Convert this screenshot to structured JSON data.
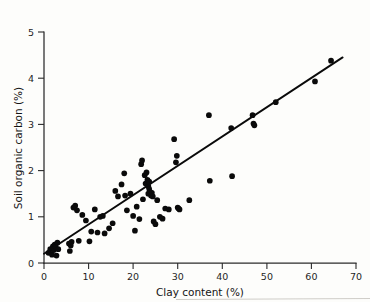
{
  "figure": {
    "background_color": "#fdfdfb",
    "ink_color": "#0a0a0a",
    "artifact_color": "#c9c7c2"
  },
  "chart_data": {
    "type": "scatter",
    "title": "",
    "subtitle": "",
    "xlabel": "Clay content (%)",
    "ylabel": "Soil organic carbon (%)",
    "xlim": [
      0,
      70
    ],
    "ylim": [
      0,
      5
    ],
    "xticks": [
      0,
      10,
      20,
      30,
      40,
      50,
      60,
      70
    ],
    "xticklabels": [
      "0",
      "10",
      "20",
      "30",
      "40",
      "50",
      "60",
      "70"
    ],
    "yticks": [
      0,
      1,
      2,
      3,
      4,
      5
    ],
    "yticklabels": [
      "0",
      "1",
      "2",
      "3",
      "4",
      "5"
    ],
    "grid": false,
    "legend": null,
    "marker": "filled-circle",
    "marker_size_px": 4.6,
    "series": [
      {
        "name": "Soil samples",
        "x": [
          1.0,
          1.4,
          1.8,
          2.0,
          2.2,
          2.4,
          2.6,
          2.8,
          3.0,
          3.2,
          5.6,
          5.8,
          6.0,
          6.2,
          6.6,
          7.0,
          7.4,
          7.8,
          8.6,
          9.4,
          10.2,
          10.6,
          11.4,
          12.0,
          12.6,
          13.2,
          13.6,
          14.6,
          15.4,
          16.0,
          16.6,
          17.4,
          18.0,
          18.2,
          18.6,
          19.4,
          20.0,
          20.4,
          20.8,
          21.4,
          21.8,
          22.0,
          22.2,
          22.6,
          22.8,
          23.0,
          23.2,
          23.4,
          23.4,
          23.6,
          23.6,
          23.8,
          24.0,
          24.2,
          24.4,
          24.6,
          25.0,
          25.4,
          26.0,
          26.6,
          27.2,
          28.0,
          29.2,
          29.6,
          29.8,
          30.0,
          30.2,
          30.4,
          32.6,
          37.0,
          37.2,
          42.0,
          42.2,
          46.8,
          47.0,
          47.2,
          52.0,
          60.8,
          64.4
        ],
        "y": [
          0.22,
          0.3,
          0.18,
          0.36,
          0.28,
          0.4,
          0.34,
          0.16,
          0.44,
          0.3,
          0.42,
          0.26,
          0.38,
          0.46,
          1.2,
          1.24,
          1.14,
          0.48,
          1.04,
          0.92,
          0.47,
          0.68,
          1.16,
          0.66,
          1.0,
          1.02,
          0.64,
          0.75,
          0.86,
          1.56,
          1.44,
          1.7,
          1.94,
          1.46,
          1.14,
          1.5,
          1.02,
          0.7,
          1.22,
          0.95,
          2.14,
          2.22,
          1.38,
          1.9,
          1.72,
          1.96,
          1.8,
          1.66,
          1.5,
          1.76,
          1.6,
          1.54,
          1.46,
          1.52,
          1.44,
          0.9,
          0.84,
          1.36,
          1.0,
          0.96,
          1.18,
          1.16,
          2.68,
          2.18,
          2.32,
          1.2,
          1.18,
          1.16,
          1.36,
          3.2,
          1.78,
          2.92,
          1.88,
          3.2,
          3.02,
          2.98,
          3.48,
          3.93,
          4.38
        ]
      }
    ],
    "fit_line": {
      "name": "Regression line",
      "x": [
        0.0,
        67.0
      ],
      "y": [
        0.2,
        4.45
      ],
      "slope": 0.0634,
      "intercept": 0.2
    },
    "annotations": []
  }
}
